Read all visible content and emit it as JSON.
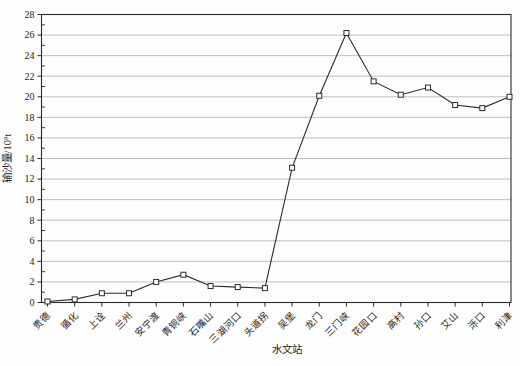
{
  "chart": {
    "xlabel": "水文站",
    "ylabel_prefix": "输沙量/10",
    "ylabel_sup": "8",
    "ylabel_suffix": "t"
  },
  "chart_data": {
    "type": "line",
    "categories": [
      "贵德",
      "循化",
      "上诠",
      "兰州",
      "安宁渡",
      "青铜峡",
      "石嘴山",
      "三湖河口",
      "头道拐",
      "吴堡",
      "龙门",
      "三门峡",
      "花园口",
      "高村",
      "孙口",
      "艾山",
      "泺口",
      "利津"
    ],
    "values": [
      0.1,
      0.3,
      0.9,
      0.9,
      2.0,
      2.7,
      1.6,
      1.5,
      1.4,
      13.1,
      20.1,
      26.2,
      21.5,
      20.2,
      20.9,
      19.2,
      18.9,
      20.0
    ],
    "title": "",
    "xlabel": "水文站",
    "ylabel": "输沙量/10⁸t",
    "ylim": [
      0,
      28
    ],
    "ytick_step": 2,
    "ytick_labels": [
      "0",
      "2",
      "4",
      "6",
      "8",
      "10",
      "12",
      "14",
      "16",
      "18",
      "20",
      "22",
      "24",
      "26",
      "28"
    ],
    "grid": "horizontal-major",
    "legend_position": "none",
    "marker": "open-square",
    "colors": {
      "line": "#2b2b2b",
      "grid": "#aeaeae",
      "frame": "#2b2b2b",
      "marker_fill": "#ffffff",
      "background": "#fdfdfd",
      "text": "#1c1c1c"
    }
  }
}
